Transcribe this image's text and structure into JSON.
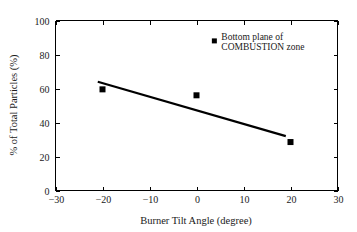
{
  "chart_data": {
    "type": "scatter",
    "title": "",
    "xlabel": "Burner Tilt Angle (degree)",
    "ylabel": "% of Total Particles (%)",
    "xlim": [
      -30,
      30
    ],
    "ylim": [
      0,
      100
    ],
    "xticks": [
      -30,
      -20,
      -10,
      0,
      10,
      20,
      30
    ],
    "xtick_labels": [
      "−30",
      "−20",
      "−10",
      "0",
      "10",
      "20",
      "30"
    ],
    "yticks": [
      0,
      20,
      40,
      60,
      80,
      100
    ],
    "ytick_labels": [
      "0",
      "20",
      "40",
      "60",
      "80",
      "100"
    ],
    "grid": false,
    "legend_position": "upper-right-inside",
    "series": [
      {
        "name": "Bottom plane of COMBUSTION zone",
        "marker": "square",
        "color": "#000000",
        "points": [
          {
            "x": -20,
            "y": 59.5
          },
          {
            "x": 0,
            "y": 56.0
          },
          {
            "x": 20,
            "y": 28.5
          }
        ]
      },
      {
        "name": "Linear trend",
        "type": "line",
        "color": "#000000",
        "points": [
          {
            "x": -21.0,
            "y": 64.0
          },
          {
            "x": 19.0,
            "y": 32.0
          }
        ]
      }
    ],
    "annotations": [
      {
        "name": "legend-entry",
        "marker": "square",
        "marker_x": 3.8,
        "marker_y": 88.0,
        "line1": "Bottom plane of",
        "line2": "COMBUSTION zone"
      }
    ]
  },
  "colors": {
    "background": "#ffffff",
    "axis": "#000000",
    "marker": "#000000",
    "trend": "#000000",
    "text": "#1a1a1a"
  }
}
